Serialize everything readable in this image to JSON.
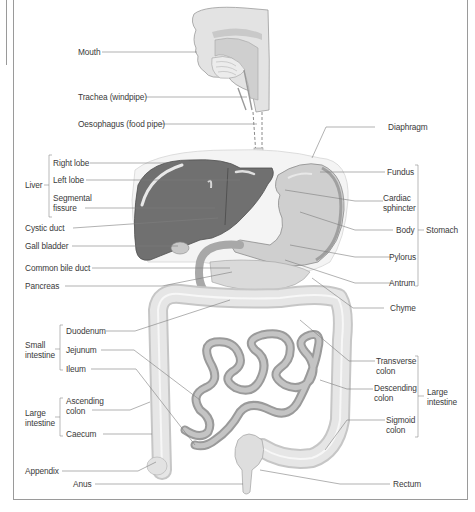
{
  "colors": {
    "liver": "#6f6f6f",
    "organ_light": "#d9d9d9",
    "organ_mid": "#bdbdbd",
    "line": "#7a7a7a",
    "text": "#3a3a3a"
  },
  "labels_left": {
    "mouth": "Mouth",
    "trachea": "Trachea (windpipe)",
    "oesophagus": "Oesophagus (food pipe)",
    "liver_group": "Liver",
    "right_lobe": "Right lobe",
    "left_lobe": "Left lobe",
    "segmental_fissure": "Segmental\nfissure",
    "cystic_duct": "Cystic duct",
    "gall_bladder": "Gall bladder",
    "common_bile_duct": "Common bile duct",
    "pancreas": "Pancreas",
    "small_intestine_group": "Small\nintestine",
    "duodenum": "Duodenum",
    "jejunum": "Jejunum",
    "ileum": "Ileum",
    "large_intestine_group": "Large\nintestine",
    "ascending_colon": "Ascending\ncolon",
    "caecum": "Caecum",
    "appendix": "Appendix",
    "anus": "Anus"
  },
  "labels_right": {
    "diaphragm": "Diaphragm",
    "fundus": "Fundus",
    "cardiac_sphincter": "Cardiac\nsphincter",
    "body": "Body",
    "pylorus": "Pylorus",
    "antrum": "Antrum",
    "stomach_group": "Stomach",
    "chyme": "Chyme",
    "transverse_colon": "Transverse\ncolon",
    "descending_colon": "Descending\ncolon",
    "sigmoid_colon": "Sigmoid\ncolon",
    "large_intestine_group": "Large\nintestine",
    "rectum": "Rectum"
  }
}
